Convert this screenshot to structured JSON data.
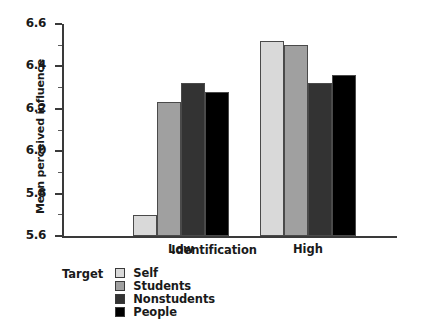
{
  "chart_data": {
    "type": "bar",
    "title": "",
    "xlabel": "Identification",
    "ylabel": "Mean perceived influence",
    "categories": [
      "Low",
      "High"
    ],
    "ylim": [
      5.6,
      6.6
    ],
    "ytick_labels": [
      "5.6",
      "5.8",
      "6.0",
      "6.2",
      "6.4",
      "6.6"
    ],
    "ytick_values": [
      5.6,
      5.8,
      6.0,
      6.2,
      6.4,
      6.6
    ],
    "yminor_values": [
      5.7,
      5.9,
      6.1,
      6.3,
      6.5
    ],
    "grid": false,
    "legend_title": "Target",
    "legend_position": "below-left",
    "series": [
      {
        "name": "Self",
        "color": "#d9d9d9",
        "values": [
          5.7,
          6.52
        ]
      },
      {
        "name": "Students",
        "color": "#a0a0a0",
        "values": [
          6.23,
          6.5
        ]
      },
      {
        "name": "Nonstudents",
        "color": "#333333",
        "values": [
          6.32,
          6.32
        ]
      },
      {
        "name": "People",
        "color": "#000000",
        "values": [
          6.28,
          6.36
        ]
      }
    ]
  },
  "axis": {
    "y_title": "Mean perceived influence",
    "x_title": "Identification"
  },
  "legend": {
    "title": "Target",
    "items": [
      {
        "label": "Self",
        "color": "#d9d9d9"
      },
      {
        "label": "Students",
        "color": "#a0a0a0"
      },
      {
        "label": "Nonstudents",
        "color": "#333333"
      },
      {
        "label": "People",
        "color": "#000000"
      }
    ]
  }
}
